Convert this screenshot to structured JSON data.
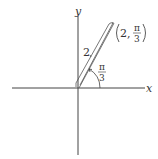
{
  "diagram": {
    "x_axis_label": "x",
    "y_axis_label": "y",
    "radius_label": "2",
    "angle_label_num": "π",
    "angle_label_den": "3",
    "point_label": {
      "r": "2",
      "theta_num": "π",
      "theta_den": "3"
    },
    "colors": {
      "stroke": "#444444",
      "text": "#333333"
    }
  }
}
